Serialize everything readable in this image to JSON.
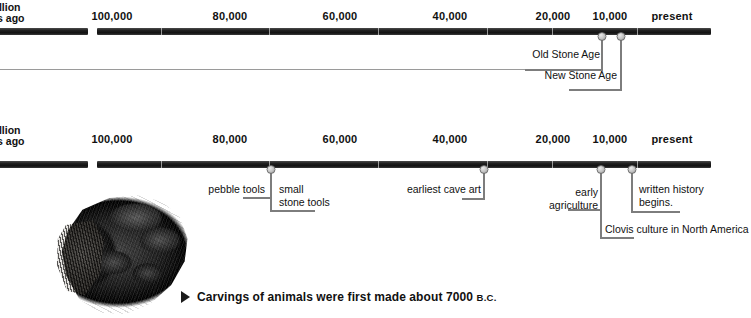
{
  "figure": {
    "kind": "prehistory-timeline",
    "edge_label_line1": "illion",
    "edge_label_line2": "rs ago"
  },
  "axis": {
    "ticks": [
      {
        "label": "100,000",
        "x": 112
      },
      {
        "label": "80,000",
        "x": 230
      },
      {
        "label": "60,000",
        "x": 340
      },
      {
        "label": "40,000",
        "x": 450
      },
      {
        "label": "20,000",
        "x": 553
      },
      {
        "label": "10,000",
        "x": 610
      },
      {
        "label": "present",
        "x": 672
      }
    ]
  },
  "timeline_top": {
    "events": [
      {
        "label": "Old Stone Age",
        "marker_x": 602
      },
      {
        "label": "New Stone Age",
        "marker_x": 621
      }
    ]
  },
  "timeline_bottom": {
    "events": [
      {
        "label": "pebble tools",
        "marker_x": 271
      },
      {
        "label": "small\nstone tools",
        "marker_x": 271
      },
      {
        "label": "earliest cave art",
        "marker_x": 484
      },
      {
        "label": "early\nagriculture",
        "marker_x": 601
      },
      {
        "label": "Clovis culture in North America",
        "marker_x": 601
      },
      {
        "label": "written history\nbegins.",
        "marker_x": 632
      }
    ]
  },
  "caption": {
    "bullet": "triangle-right-icon",
    "text": "Carvings of animals were first made about 7000 ",
    "era": "B.C."
  },
  "photo": {
    "alt_name": "carved-stone-artifact-photo"
  },
  "colors": {
    "bar": "#141414",
    "marker": "#c2c2c2",
    "leader": "#7d7d7d",
    "text": "#111111",
    "background": "#ffffff"
  }
}
